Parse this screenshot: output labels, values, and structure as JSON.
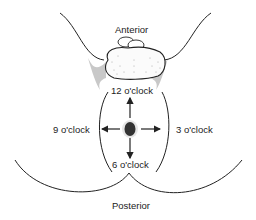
{
  "diagram": {
    "labels": {
      "anterior": "Anterior",
      "posterior": "Posterior",
      "twelve": "12 o'clock",
      "three": "3 o'clock",
      "six": "6 o'clock",
      "nine": "9 o'clock"
    },
    "colors": {
      "line": "#222222",
      "shading": "#c8c8c8",
      "center_dark": "#333333",
      "background": "#ffffff"
    }
  }
}
